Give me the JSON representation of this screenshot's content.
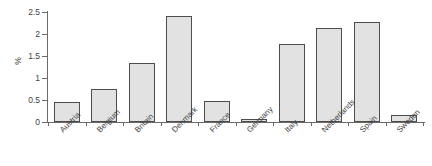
{
  "chart_data": {
    "type": "bar",
    "title": "",
    "xlabel": "",
    "ylabel": "%",
    "categories": [
      "Austria",
      "Belgium",
      "Britain",
      "Denmark",
      "France",
      "Germany",
      "Italy",
      "Netherlands",
      "Spain",
      "Sweden"
    ],
    "values": [
      0.46,
      0.74,
      1.33,
      2.42,
      0.47,
      0.07,
      1.78,
      2.14,
      2.27,
      0.15
    ],
    "ylim": [
      0,
      2.5
    ],
    "yticks": [
      0,
      0.5,
      1,
      1.5,
      2,
      2.5
    ],
    "ytick_labels": [
      "0",
      "0.5",
      "1",
      "1.5",
      "2",
      "2.5"
    ],
    "grid": false,
    "legend": "none",
    "bar_fill": "#e2e2e2",
    "bar_edge": "#4d4d4d",
    "axis_color": "#6b6b6b",
    "background": "#ffffff"
  }
}
